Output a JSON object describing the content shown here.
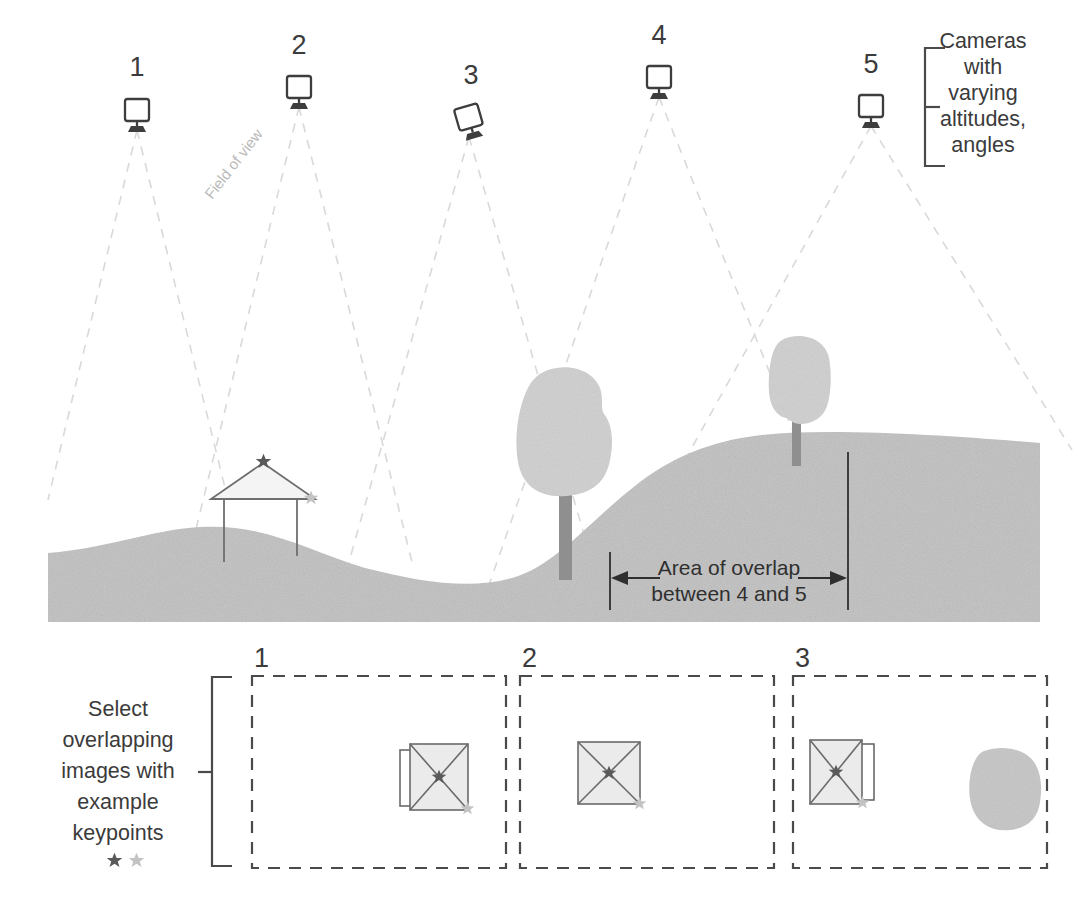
{
  "diagram": {
    "annotations": {
      "cameras_note": [
        "Cameras",
        "with",
        "varying",
        "altitudes,",
        "angles"
      ],
      "cameras_note_text": "Cameras with varying altitudes, angles",
      "field_of_view": "Field of view",
      "overlap_line1": "Area of overlap",
      "overlap_line2": "between 4 and 5",
      "select_note": [
        "Select",
        "overlapping",
        "images with",
        "example",
        "keypoints"
      ],
      "select_note_text": "Select overlapping images with example keypoints"
    },
    "cameras": [
      {
        "id": "1",
        "label": "1",
        "x": 137,
        "y": 118,
        "label_x": 137,
        "label_y": 66,
        "tilt": 0,
        "fov_left_x": 48,
        "fov_right_x": 228,
        "fov_bottom_y": 500
      },
      {
        "id": "2",
        "label": "2",
        "x": 299,
        "y": 94,
        "label_x": 299,
        "label_y": 44,
        "tilt": 0,
        "fov_left_x": 188,
        "fov_right_x": 412,
        "fov_bottom_y": 562
      },
      {
        "id": "3",
        "label": "3",
        "x": 469,
        "y": 124,
        "label_x": 469,
        "label_y": 72,
        "tilt": -16,
        "fov_left_x": 345,
        "fov_right_x": 596,
        "fov_bottom_y": 576
      },
      {
        "id": "4",
        "label": "4",
        "x": 659,
        "y": 84,
        "label_x": 659,
        "label_y": 34,
        "tilt": 0,
        "fov_left_x": 489,
        "fov_right_x": 855,
        "fov_bottom_y": 585
      },
      {
        "id": "5",
        "label": "5",
        "x": 871,
        "y": 113,
        "label_x": 871,
        "label_y": 61,
        "tilt": 0,
        "fov_left_x": 607,
        "fov_right_x": 1065,
        "fov_bottom_y": 460
      }
    ],
    "overlap_marks": {
      "left_x": 610,
      "right_x": 848,
      "top_y": 452,
      "bottom_y": 610,
      "arrow_y": 578
    },
    "panels": [
      {
        "label": "1",
        "x": 252,
        "y": 676,
        "w": 254,
        "h": 192,
        "plan": {
          "cx": 438,
          "cy": 778,
          "size": 58,
          "side": "left",
          "has_side": true,
          "dark_star": {
            "dx": 0,
            "dy": 0
          },
          "light_star": {
            "dx": 29,
            "dy": 30
          }
        },
        "blob": null
      },
      {
        "label": "2",
        "x": 520,
        "y": 676,
        "w": 254,
        "h": 192,
        "plan": {
          "cx": 608,
          "cy": 775,
          "size": 58,
          "side": "none",
          "has_side": false,
          "dark_star": {
            "dx": 0,
            "dy": 0
          },
          "light_star": {
            "dx": 29,
            "dy": 30
          }
        },
        "blob": null
      },
      {
        "label": "3",
        "x": 793,
        "y": 676,
        "w": 254,
        "h": 192,
        "plan": {
          "cx": 833,
          "cy": 776,
          "size": 58,
          "side": "right",
          "has_side": true,
          "dark_star": {
            "dx": 0,
            "dy": 0
          },
          "light_star": {
            "dx": 29,
            "dy": 30
          }
        },
        "blob": {
          "cx": 1005,
          "cy": 790
        }
      }
    ],
    "legend_stars": [
      {
        "tone": "dark"
      },
      {
        "tone": "light"
      }
    ],
    "house": {
      "peak_x": 263,
      "peak_y": 461,
      "eave_left_x": 213,
      "eave_right_x": 313,
      "eave_y": 497,
      "wall_left_x": 222,
      "wall_right_x": 296,
      "wall_bottom_y": 560,
      "dark_star": {
        "x": 263,
        "y": 461
      },
      "light_star": {
        "x": 310,
        "y": 498
      }
    },
    "trees": [
      {
        "canopy_cx": 561,
        "canopy_cy": 430,
        "trunk_x": 566,
        "trunk_top": 490,
        "trunk_bottom": 578
      },
      {
        "canopy_cx": 800,
        "canopy_cy": 384,
        "trunk_x": 797,
        "trunk_top": 420,
        "trunk_bottom": 463
      }
    ],
    "colors": {
      "ink": "#3a3a3a",
      "fov_dash": "#d9d9d9",
      "terrain": "#c6c6c6",
      "canopy": "#d2d2d2",
      "trunk": "#8f8f8f",
      "star_dark": "#5a5a5a",
      "star_light": "#c3c3c3",
      "panel_border": "#4a4a4a",
      "plan_fill": "#ebebeb"
    }
  }
}
